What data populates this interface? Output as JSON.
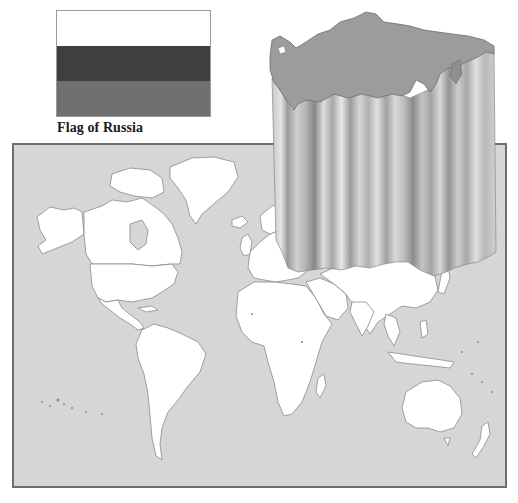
{
  "flag": {
    "country": "Russia",
    "caption": "Flag of Russia",
    "bands": [
      {
        "name": "top",
        "color": "#ffffff"
      },
      {
        "name": "middle",
        "color": "#3f3f3f"
      },
      {
        "name": "bottom",
        "color": "#707070"
      }
    ]
  },
  "map": {
    "type": "world political outline map",
    "ocean_color": "#d6d6d6",
    "land_color": "#ffffff",
    "border_color": "#8a8a8a",
    "frame_color": "#6e6e6e",
    "highlighted_country": "Russia",
    "highlight_style": "3D extruded column",
    "highlight_top_color": "#9c9c9c"
  }
}
